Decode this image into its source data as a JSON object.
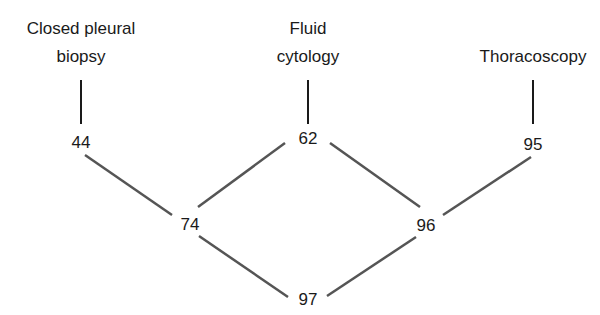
{
  "diagram": {
    "type": "tree",
    "sources": [
      {
        "label_line1": "Closed pleural",
        "label_line2": "biopsy",
        "value": "44"
      },
      {
        "label_line1": "Fluid",
        "label_line2": "cytology",
        "value": "62"
      },
      {
        "label_line1": "Thoracoscopy",
        "label_line2": "",
        "value": "95"
      }
    ],
    "combinations": [
      {
        "value": "74",
        "from": [
          "44",
          "62"
        ]
      },
      {
        "value": "96",
        "from": [
          "62",
          "95"
        ]
      },
      {
        "value": "97",
        "from": [
          "74",
          "96"
        ]
      }
    ],
    "colors": {
      "source_line": "#1a1a1a",
      "edge_line": "#555555",
      "text": "#1a1a1a"
    }
  }
}
